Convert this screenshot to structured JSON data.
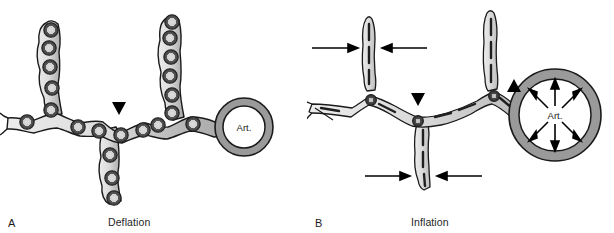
{
  "figure": {
    "width": 614,
    "height": 233,
    "background": "#ffffff",
    "type": "scientific-diagram"
  },
  "colors": {
    "outline": "#1a1a1a",
    "capillary_light": "#e8e8e8",
    "capillary_mid": "#c8c8c8",
    "capillary_dark": "#a8a8a8",
    "cell_ring_dark": "#4d4d4d",
    "cell_core_light": "#d8d8d8",
    "arteriole_wall": "#9a9a9a",
    "arteriole_lumen": "#ffffff",
    "marker_black": "#000000",
    "text": "#1a1a1a"
  },
  "panels": [
    {
      "id": "A",
      "letter": "A",
      "caption": "Deflation",
      "vessel_label": "Art.",
      "state": "deflation",
      "description": "Capillary segments are short, wide and beaded with bulging endothelial cells; the arteriole is small and constricted.",
      "markers": [
        {
          "name": "capillary-marker",
          "glyph": "down-triangle",
          "direction": "down"
        }
      ],
      "arteriole": {
        "label": "Art.",
        "outer_radius": 29,
        "inner_radius": 21,
        "center_x": 244,
        "center_y": 127,
        "arrows": []
      },
      "capillary_style": "beaded-wide",
      "cell_count": 21
    },
    {
      "id": "B",
      "letter": "B",
      "caption": "Inflation",
      "vessel_label": "Art.",
      "state": "inflation",
      "description": "Capillary segments are stretched, long and narrow with flattened endothelium; the arteriole is distended and arrows radiate outward.",
      "markers": [
        {
          "name": "capillary-marker",
          "glyph": "down-triangle",
          "direction": "down"
        },
        {
          "name": "arteriole-marker",
          "glyph": "up-triangle",
          "direction": "up"
        }
      ],
      "compression_arrows": [
        {
          "name": "compression-arrow-upper-left",
          "direction": "right",
          "x1": 5,
          "y1": 48,
          "x2": 50,
          "y2": 48
        },
        {
          "name": "compression-arrow-upper-right",
          "direction": "left",
          "x1": 120,
          "y1": 48,
          "x2": 75,
          "y2": 48
        },
        {
          "name": "compression-arrow-lower-left",
          "direction": "right",
          "x1": 78,
          "y1": 176,
          "x2": 122,
          "y2": 176
        },
        {
          "name": "compression-arrow-lower-right",
          "direction": "left",
          "x1": 190,
          "y1": 176,
          "x2": 146,
          "y2": 176
        }
      ],
      "arteriole": {
        "label": "Art.",
        "outer_radius": 46,
        "inner_radius": 36,
        "center_x": 248,
        "center_y": 115,
        "arrow_count": 8,
        "arrow_direction": "outward-radial"
      },
      "capillary_style": "stretched-narrow",
      "cell_count": 3
    }
  ]
}
